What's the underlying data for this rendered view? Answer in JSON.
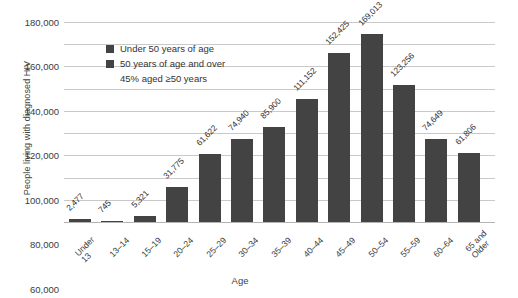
{
  "chart_data": {
    "type": "bar",
    "title": "",
    "xlabel": "Age",
    "ylabel": "People living with diagnosed HIV",
    "categories": [
      "Under 13",
      "13–14",
      "15–19",
      "20–24",
      "25–29",
      "30–34",
      "35–39",
      "40–44",
      "45–49",
      "50–54",
      "55–59",
      "60–64",
      "65 and\nOlder"
    ],
    "values": [
      2477,
      745,
      5321,
      31775,
      61622,
      74940,
      85900,
      111152,
      152425,
      169013,
      123256,
      74649,
      61806
    ],
    "value_labels": [
      "2,477",
      "745",
      "5,321",
      "31,775",
      "61,622",
      "74,940",
      "85,900",
      "111,152",
      "152,425",
      "169,013",
      "123,256",
      "74,649",
      "61,806"
    ],
    "ylim": [
      0,
      180000
    ],
    "ytick_values": [
      0,
      20000,
      40000,
      60000,
      80000,
      100000,
      120000,
      140000,
      160000,
      180000
    ],
    "ytick_labels": [
      "0",
      "20,000",
      "40,000",
      "60,000",
      "80,000",
      "100,000",
      "120,000",
      "140,000",
      "160,000",
      "180,000"
    ],
    "grid": true,
    "legend_position": "upper-left",
    "bar_color": "#434343",
    "grid_color": "#c9c9c9",
    "series": [
      {
        "name": "Under 50 years of age",
        "color": "#434343"
      },
      {
        "name": "50 years of age and over",
        "color": "#434343"
      }
    ],
    "annotations": [
      "45% aged ≥50 years"
    ]
  },
  "legend": {
    "items": [
      {
        "label": "Under 50 years of age"
      },
      {
        "label": "50 years of age and over"
      }
    ],
    "note": "45% aged ≥50 years"
  }
}
